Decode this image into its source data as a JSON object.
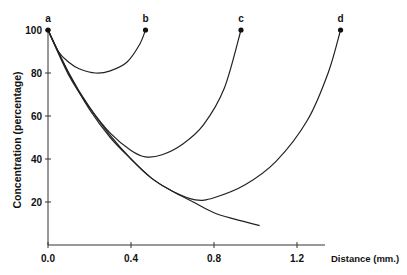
{
  "chart_data": {
    "type": "line",
    "title": "",
    "xlabel": "Distance (mm.)",
    "ylabel": "Concentration (percentage)",
    "xlim": [
      0,
      1.4
    ],
    "ylim": [
      0,
      100
    ],
    "x_ticks": [
      0.0,
      0.4,
      0.8,
      1.2
    ],
    "x_tick_labels": [
      "0.0",
      "0.4",
      "0.8",
      "1.2"
    ],
    "y_ticks": [
      20,
      40,
      60,
      80,
      100
    ],
    "y_tick_labels": [
      "20",
      "40",
      "60",
      "80",
      "100"
    ],
    "grid": false,
    "legend": "none (curves labelled a-d at endpoints)",
    "point_labels": [
      {
        "label": "a",
        "x": 0.0,
        "y": 100
      },
      {
        "label": "b",
        "x": 0.47,
        "y": 100
      },
      {
        "label": "c",
        "x": 0.93,
        "y": 100
      },
      {
        "label": "d",
        "x": 1.41,
        "y": 100
      }
    ],
    "series": [
      {
        "name": "a (decay)",
        "x": [
          0.0,
          0.1,
          0.2,
          0.3,
          0.4,
          0.5,
          0.6,
          0.7,
          0.8,
          0.9,
          1.02
        ],
        "y": [
          100,
          80,
          63,
          50,
          40,
          31,
          25,
          20,
          15,
          12,
          9
        ]
      },
      {
        "name": "a-b",
        "x": [
          0.0,
          0.05,
          0.1,
          0.15,
          0.23,
          0.3,
          0.38,
          0.44,
          0.47
        ],
        "y": [
          100,
          90,
          85,
          82,
          80,
          81,
          85,
          93,
          100
        ]
      },
      {
        "name": "a-c",
        "x": [
          0.0,
          0.1,
          0.2,
          0.3,
          0.4,
          0.47,
          0.55,
          0.65,
          0.75,
          0.85,
          0.93
        ],
        "y": [
          100,
          79,
          64,
          52,
          44,
          41,
          42,
          47,
          56,
          73,
          100
        ]
      },
      {
        "name": "a-d",
        "x": [
          0.0,
          0.1,
          0.2,
          0.3,
          0.4,
          0.5,
          0.6,
          0.71,
          0.8,
          0.95,
          1.1,
          1.25,
          1.35,
          1.41
        ],
        "y": [
          100,
          80,
          64,
          51,
          40,
          31,
          25,
          21,
          22,
          28,
          39,
          58,
          80,
          100
        ]
      }
    ]
  }
}
